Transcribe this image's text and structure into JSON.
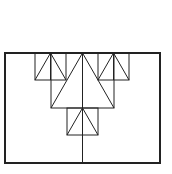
{
  "diagram": {
    "colors": {
      "stroke": "#222222",
      "background": "#ffffff"
    },
    "outer_rect": {
      "x": 5,
      "y": 53,
      "w": 155,
      "h": 110,
      "stroke_width": 2
    },
    "center_line": {
      "x": 82,
      "y1": 53,
      "y2": 163
    },
    "squares": [
      {
        "id": "big",
        "x": 51,
        "y": 53,
        "w": 63,
        "h": 55
      },
      {
        "id": "top-left",
        "x": 35,
        "y": 53,
        "w": 31,
        "h": 27
      },
      {
        "id": "top-right",
        "x": 98,
        "y": 53,
        "w": 31,
        "h": 27
      },
      {
        "id": "bottom",
        "x": 67,
        "y": 108,
        "w": 31,
        "h": 27
      }
    ]
  }
}
